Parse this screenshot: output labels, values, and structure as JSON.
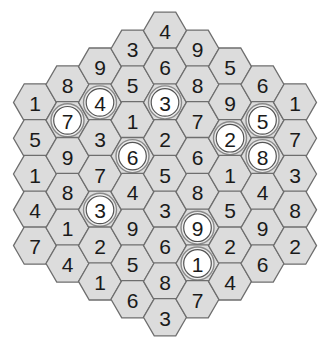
{
  "puzzle": {
    "type": "hexagonal number grid",
    "colors": {
      "hex_fill": "#dcdcdc",
      "hex_stroke": "#6e6e6e",
      "circle_fill": "#ffffff",
      "circle_ring": "#8a8a8a",
      "digit": "#1a1a1a",
      "background": "#ffffff"
    },
    "columns": [
      {
        "index": 0,
        "cells": [
          {
            "value": "1",
            "circled": false
          },
          {
            "value": "5",
            "circled": false
          },
          {
            "value": "1",
            "circled": false
          },
          {
            "value": "4",
            "circled": false
          },
          {
            "value": "7",
            "circled": false
          }
        ]
      },
      {
        "index": 1,
        "cells": [
          {
            "value": "8",
            "circled": false
          },
          {
            "value": "7",
            "circled": true
          },
          {
            "value": "9",
            "circled": false
          },
          {
            "value": "8",
            "circled": false
          },
          {
            "value": "1",
            "circled": false
          },
          {
            "value": "4",
            "circled": false
          }
        ]
      },
      {
        "index": 2,
        "cells": [
          {
            "value": "9",
            "circled": false
          },
          {
            "value": "4",
            "circled": true
          },
          {
            "value": "3",
            "circled": false
          },
          {
            "value": "7",
            "circled": false
          },
          {
            "value": "3",
            "circled": true
          },
          {
            "value": "2",
            "circled": false
          },
          {
            "value": "1",
            "circled": false
          }
        ]
      },
      {
        "index": 3,
        "cells": [
          {
            "value": "3",
            "circled": false
          },
          {
            "value": "5",
            "circled": false
          },
          {
            "value": "1",
            "circled": false
          },
          {
            "value": "6",
            "circled": true
          },
          {
            "value": "4",
            "circled": false
          },
          {
            "value": "9",
            "circled": false
          },
          {
            "value": "5",
            "circled": false
          },
          {
            "value": "6",
            "circled": false
          }
        ]
      },
      {
        "index": 4,
        "cells": [
          {
            "value": "4",
            "circled": false
          },
          {
            "value": "6",
            "circled": false
          },
          {
            "value": "3",
            "circled": true
          },
          {
            "value": "2",
            "circled": false
          },
          {
            "value": "5",
            "circled": false
          },
          {
            "value": "3",
            "circled": false
          },
          {
            "value": "6",
            "circled": false
          },
          {
            "value": "8",
            "circled": false
          },
          {
            "value": "3",
            "circled": false
          }
        ]
      },
      {
        "index": 5,
        "cells": [
          {
            "value": "9",
            "circled": false
          },
          {
            "value": "8",
            "circled": false
          },
          {
            "value": "7",
            "circled": false
          },
          {
            "value": "6",
            "circled": false
          },
          {
            "value": "8",
            "circled": false
          },
          {
            "value": "9",
            "circled": true
          },
          {
            "value": "1",
            "circled": true
          },
          {
            "value": "7",
            "circled": false
          }
        ]
      },
      {
        "index": 6,
        "cells": [
          {
            "value": "5",
            "circled": false
          },
          {
            "value": "9",
            "circled": false
          },
          {
            "value": "2",
            "circled": true
          },
          {
            "value": "1",
            "circled": false
          },
          {
            "value": "5",
            "circled": false
          },
          {
            "value": "2",
            "circled": false
          },
          {
            "value": "4",
            "circled": false
          }
        ]
      },
      {
        "index": 7,
        "cells": [
          {
            "value": "6",
            "circled": false
          },
          {
            "value": "5",
            "circled": true
          },
          {
            "value": "8",
            "circled": true
          },
          {
            "value": "4",
            "circled": false
          },
          {
            "value": "9",
            "circled": false
          },
          {
            "value": "6",
            "circled": false
          }
        ]
      },
      {
        "index": 8,
        "cells": [
          {
            "value": "1",
            "circled": false
          },
          {
            "value": "7",
            "circled": false
          },
          {
            "value": "3",
            "circled": false
          },
          {
            "value": "8",
            "circled": false
          },
          {
            "value": "2",
            "circled": false
          }
        ]
      }
    ]
  }
}
